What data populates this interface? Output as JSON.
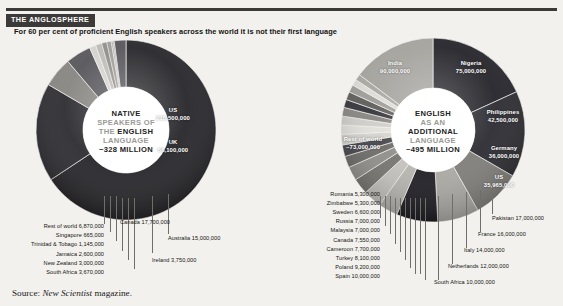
{
  "header": {
    "eyebrow": "THE ANGLOSPHERE",
    "subtitle": "For 60 per cent of proficient English speakers across the world it is not their first language"
  },
  "source": {
    "prefix": "Source:",
    "publication": "New Scientist",
    "suffix": "magazine."
  },
  "colors": {
    "header_bar": "#3b3a38",
    "background": "#f2f1ee",
    "dark_segment": "#26262a",
    "mid_segment": "#6e6e6c",
    "light_segment": "#c9c8c3",
    "hub": "#ffffff",
    "leader_line": "#6f6e68"
  },
  "chart_data": [
    {
      "type": "pie",
      "id": "native-speakers",
      "title": "NATIVE SPEAKERS OF THE ENGLISH LANGUAGE ~328 MILLION",
      "center_lines": [
        {
          "text": "NATIVE",
          "style": "bold"
        },
        {
          "text": "SPEAKERS OF",
          "style": "grey"
        },
        {
          "text": "THE ENGLISH",
          "style": "mixed"
        },
        {
          "text": "LANGUAGE",
          "style": "grey"
        },
        {
          "text": "~328 MILLION",
          "style": "bold"
        }
      ],
      "total": 328000000,
      "total_label": "~328 MILLION",
      "unit": "people",
      "categories": [
        "US",
        "UK",
        "Canada",
        "Australia",
        "Ireland",
        "South Africa",
        "New Zealand",
        "Jamaica",
        "Trinidad & Tobago",
        "Singapore",
        "Rest of world"
      ],
      "values": [
        215500000,
        58100000,
        17700000,
        15000000,
        3750000,
        3670000,
        3000000,
        2600000,
        1145000,
        665000,
        6870000
      ],
      "value_labels": [
        "215,500,000",
        "58,100,000",
        "17,700,000",
        "15,000,000",
        "3,750,000",
        "3,670,000",
        "3,000,000",
        "2,600,000",
        "1,145,000",
        "665,000",
        "6,870,000"
      ],
      "inside_labels": [
        {
          "name": "US",
          "value": "215,500,000"
        },
        {
          "name": "UK",
          "value": "58,100,000"
        }
      ],
      "callouts_right": [
        {
          "name": "Canada",
          "value": "17,700,000"
        },
        {
          "name": "Australia",
          "value": "15,000,000"
        },
        {
          "name": "Ireland",
          "value": "3,750,000"
        }
      ],
      "callouts_left": [
        {
          "name": "Rest of world",
          "value": "6,870,000"
        },
        {
          "name": "Singapore",
          "value": "665,000"
        },
        {
          "name": "Trinidad & Tobago",
          "value": "1,145,000"
        },
        {
          "name": "Jamaica",
          "value": "2,600,000"
        },
        {
          "name": "New Zealand",
          "value": "3,000,000"
        },
        {
          "name": "South Africa",
          "value": "3,670,000"
        }
      ]
    },
    {
      "type": "pie",
      "id": "english-additional-language",
      "title": "ENGLISH AS AN ADDITIONAL LANGUAGE ~495 MILLION",
      "center_lines": [
        {
          "text": "ENGLISH",
          "style": "bold"
        },
        {
          "text": "AS AN",
          "style": "grey"
        },
        {
          "text": "ADDITIONAL",
          "style": "bold"
        },
        {
          "text": "LANGUAGE",
          "style": "grey"
        },
        {
          "text": "~495 MILLION",
          "style": "bold"
        }
      ],
      "total": 495000000,
      "total_label": "~495 MILLION",
      "unit": "people",
      "categories": [
        "India",
        "Nigeria",
        "Philippines",
        "Germany",
        "US",
        "Pakistan",
        "France",
        "Italy",
        "Netherlands",
        "South Africa",
        "Spain",
        "Poland",
        "Turkey",
        "Cameroon",
        "Canada",
        "Malaysia",
        "Russia",
        "Sweden",
        "Zimbabwe",
        "Romania",
        "Rest of world"
      ],
      "values": [
        90000000,
        75000000,
        42500000,
        36000000,
        35965000,
        17000000,
        16000000,
        14000000,
        12000000,
        10000000,
        10000000,
        9200000,
        8100000,
        7700000,
        7550000,
        7000000,
        7000000,
        6600000,
        5300000,
        5300000,
        73000000
      ],
      "value_labels": [
        "90,000,000",
        "75,000,000",
        "42,500,000",
        "36,000,000",
        "35,965,000",
        "17,000,000",
        "16,000,000",
        "14,000,000",
        "12,000,000",
        "10,000,000",
        "10,000,000",
        "9,200,000",
        "8,100,000",
        "7,700,000",
        "7,550,000",
        "7,000,000",
        "7,000,000",
        "6,600,000",
        "5,300,000",
        "5,300,000",
        "~73,000,000"
      ],
      "inside_labels": [
        {
          "name": "India",
          "value": "90,000,000"
        },
        {
          "name": "Nigeria",
          "value": "75,000,000"
        },
        {
          "name": "Philippines",
          "value": "42,500,000"
        },
        {
          "name": "Germany",
          "value": "36,000,000"
        },
        {
          "name": "US",
          "value": "35,965,000"
        },
        {
          "name": "Rest of world",
          "value": "~73,000,000"
        }
      ],
      "callouts_right": [
        {
          "name": "Pakistan",
          "value": "17,000,000"
        },
        {
          "name": "France",
          "value": "16,000,000"
        },
        {
          "name": "Italy",
          "value": "14,000,000"
        },
        {
          "name": "Netherlands",
          "value": "12,000,000"
        },
        {
          "name": "South Africa",
          "value": "10,000,000"
        }
      ],
      "callouts_left": [
        {
          "name": "Romania",
          "value": "5,300,000"
        },
        {
          "name": "Zimbabwe",
          "value": "5,300,000"
        },
        {
          "name": "Sweden",
          "value": "6,600,000"
        },
        {
          "name": "Russia",
          "value": "7,000,000"
        },
        {
          "name": "Malaysia",
          "value": "7,000,000"
        },
        {
          "name": "Canada",
          "value": "7,550,000"
        },
        {
          "name": "Cameroon",
          "value": "7,700,000"
        },
        {
          "name": "Turkey",
          "value": "8,100,000"
        },
        {
          "name": "Poland",
          "value": "9,200,000"
        },
        {
          "name": "Spain",
          "value": "10,000,000"
        }
      ]
    }
  ]
}
